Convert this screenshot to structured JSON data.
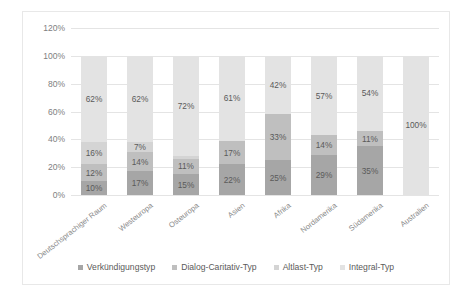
{
  "chart_data": {
    "type": "bar",
    "subtype": "100% stacked bar",
    "title": "",
    "xlabel": "",
    "ylabel": "",
    "ylim": [
      0,
      120
    ],
    "ytick_labels": [
      "0%",
      "20%",
      "40%",
      "60%",
      "80%",
      "100%",
      "120%"
    ],
    "yticks": [
      0,
      20,
      40,
      60,
      80,
      100,
      120
    ],
    "grid": true,
    "legend_position": "bottom",
    "categories": [
      "Deutschsprachiger Raum",
      "Westeuropa",
      "Osteuropa",
      "Asien",
      "Afrika",
      "Nordamerika",
      "Südamerika",
      "Australien"
    ],
    "series": [
      {
        "name": "Verkündigungstyp",
        "color": "#a6a6a6",
        "values": [
          10,
          17,
          15,
          22,
          25,
          29,
          35,
          null
        ],
        "labels": [
          "10%",
          "17%",
          "15%",
          "22%",
          "25%",
          "29%",
          "35%",
          ""
        ]
      },
      {
        "name": "Dialog-Caritativ-Typ",
        "color": "#bfbfbf",
        "values": [
          12,
          14,
          11,
          17,
          33,
          14,
          11,
          null
        ],
        "labels": [
          "12%",
          "14%",
          "11%",
          "17%",
          "33%",
          "14%",
          "11%",
          ""
        ]
      },
      {
        "name": "Altlast-Typ",
        "color": "#d4d4d4",
        "values": [
          16,
          7,
          2,
          null,
          null,
          null,
          null,
          null
        ],
        "labels": [
          "16%",
          "7%",
          "2%",
          "",
          "",
          "",
          "",
          ""
        ]
      },
      {
        "name": "Integral-Typ",
        "color": "#e3e3e3",
        "values": [
          62,
          62,
          72,
          61,
          42,
          57,
          54,
          100
        ],
        "labels": [
          "62%",
          "62%",
          "72%",
          "61%",
          "42%",
          "57%",
          "54%",
          "100%"
        ]
      }
    ]
  }
}
